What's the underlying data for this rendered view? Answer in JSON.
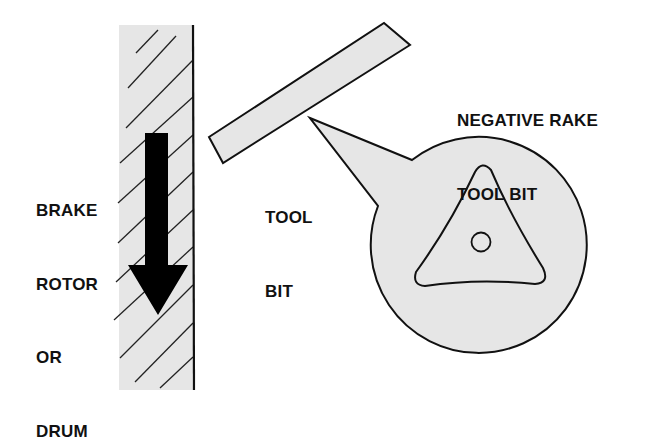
{
  "diagram": {
    "labels": {
      "brake_rotor": [
        "BRAKE",
        "ROTOR",
        "OR",
        "DRUM"
      ],
      "tool_bit": [
        "TOOL",
        "BIT"
      ],
      "negative_rake": [
        "NEGATIVE RAKE",
        "TOOL BIT"
      ]
    },
    "colors": {
      "fill_gray": "#e6e6e6",
      "stroke": "#111111",
      "arrow": "#000000"
    },
    "components": [
      "brake-rotor-section",
      "rotation-arrow",
      "tool-bit",
      "callout-magnified-view",
      "triangular-insert",
      "insert-center-hole"
    ]
  }
}
